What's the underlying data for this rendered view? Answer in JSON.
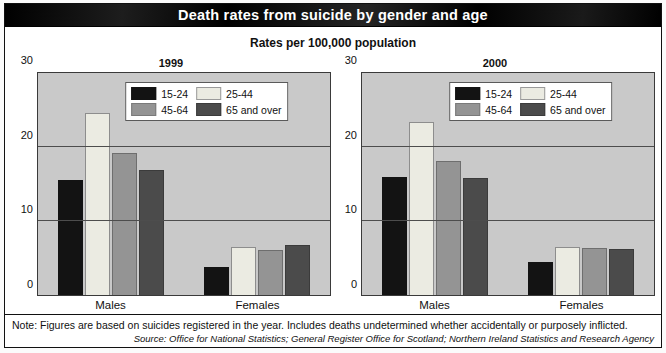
{
  "header": {
    "title": "Death rates from suicide by gender and age",
    "subtitle": "Rates per 100,000 population"
  },
  "footnotes": {
    "note": "Note: Figures are based on suicides registered in the year. Includes deaths undetermined whether accidentally or purposely inflicted.",
    "source": "Source: Office for National Statistics; General Register Office for Scotland; Northern Ireland Statistics and Research Agency"
  },
  "colors": {
    "series_15_24": "#131313",
    "series_25_44": "#ebebe2",
    "series_45_64": "#949494",
    "series_65_over": "#4b4b4b",
    "plot_background": "#c9c9c9",
    "banner": "#0a0a0a"
  },
  "chart_data": [
    {
      "type": "bar",
      "title": "1999",
      "xlabel": "",
      "ylabel": "",
      "ylim": [
        0,
        30
      ],
      "yticks": [
        0,
        10,
        20,
        30
      ],
      "ytick_labels": [
        "0",
        "10",
        "20",
        "30"
      ],
      "grid": true,
      "legend_position": "top-center",
      "categories": [
        "Males",
        "Females"
      ],
      "series": [
        {
          "name": "15-24",
          "values": [
            15.6,
            3.8
          ]
        },
        {
          "name": "25-44",
          "values": [
            24.6,
            6.5
          ]
        },
        {
          "name": "45-64",
          "values": [
            19.2,
            6.1
          ]
        },
        {
          "name": "65 and over",
          "values": [
            16.9,
            6.8
          ]
        }
      ]
    },
    {
      "type": "bar",
      "title": "2000",
      "xlabel": "",
      "ylabel": "",
      "ylim": [
        0,
        30
      ],
      "yticks": [
        0,
        10,
        20,
        30
      ],
      "ytick_labels": [
        "0",
        "10",
        "20",
        "30"
      ],
      "grid": true,
      "legend_position": "top-center",
      "categories": [
        "Males",
        "Females"
      ],
      "series": [
        {
          "name": "15-24",
          "values": [
            16.0,
            4.4
          ]
        },
        {
          "name": "25-44",
          "values": [
            23.4,
            6.5
          ]
        },
        {
          "name": "45-64",
          "values": [
            18.1,
            6.4
          ]
        },
        {
          "name": "65 and over",
          "values": [
            15.8,
            6.2
          ]
        }
      ]
    }
  ]
}
